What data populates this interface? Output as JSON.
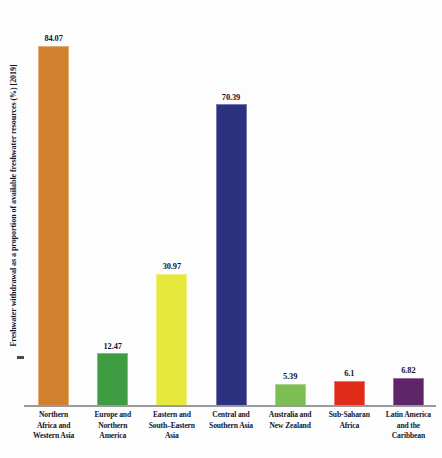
{
  "chart_data": {
    "type": "bar",
    "title": "",
    "xlabel": "",
    "ylabel": "Freshwater withdrawal as a proportion of available freshwater resources (%) [2019]",
    "ylim": [
      0,
      90
    ],
    "grid": false,
    "legend": "none",
    "categories": [
      "Northern Africa and Western Asia",
      "Europe and Northern America",
      "Eastern and South-Eastern Asia",
      "Central and Southern Asia",
      "Australia and New Zealand",
      "Sub-Saharan Africa",
      "Latin America and the Caribbean"
    ],
    "category_lines": [
      [
        "Northern",
        "Africa and",
        "Western Asia"
      ],
      [
        "Europe and",
        "Northern",
        "America"
      ],
      [
        "Eastern and",
        "South–Eastern",
        "Asia"
      ],
      [
        "Central and",
        "Southern Asia"
      ],
      [
        "Australia and",
        "New Zealand"
      ],
      [
        "Sub-Saharan",
        "Africa"
      ],
      [
        "Latin America",
        "and the",
        "Caribbean"
      ]
    ],
    "values": [
      84.07,
      12.47,
      30.97,
      70.39,
      5.39,
      6.1,
      6.82
    ],
    "value_labels": [
      "84.07",
      "12.47",
      "30.97",
      "70.39",
      "5.39",
      "6.1",
      "6.82"
    ],
    "colors": [
      "#D2822E",
      "#3E9C42",
      "#E6E83C",
      "#2B3380",
      "#7DBE52",
      "#E02B18",
      "#5E2569"
    ]
  },
  "axis": {
    "y_title": "Freshwater withdrawal as a proportion of available freshwater resources (%) [2019]"
  },
  "footer": {
    "cutoff_text": ""
  }
}
